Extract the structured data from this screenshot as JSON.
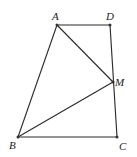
{
  "diagram": {
    "type": "geometry",
    "points": {
      "A": {
        "label": "A",
        "x": 57,
        "y": 25
      },
      "D": {
        "label": "D",
        "x": 110,
        "y": 25
      },
      "M": {
        "label": "M",
        "x": 113,
        "y": 82
      },
      "B": {
        "label": "B",
        "x": 18,
        "y": 137
      },
      "C": {
        "label": "C",
        "x": 117,
        "y": 137
      }
    },
    "segments": [
      [
        "A",
        "D"
      ],
      [
        "D",
        "C"
      ],
      [
        "C",
        "B"
      ],
      [
        "B",
        "A"
      ],
      [
        "A",
        "M"
      ],
      [
        "B",
        "M"
      ]
    ],
    "labels": {
      "A": "A",
      "D": "D",
      "M": "M",
      "B": "B",
      "C": "C"
    }
  }
}
